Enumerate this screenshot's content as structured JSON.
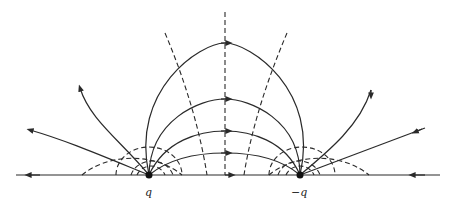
{
  "diagram": {
    "colors": {
      "line": "#2a2a2a",
      "background": "#ffffff"
    },
    "charges": [
      {
        "label": "q",
        "x": 149,
        "y": 175
      },
      {
        "label": "−q",
        "x": 300,
        "y": 175
      }
    ],
    "legend": {
      "solid": "field lines",
      "dashed": "equipotentials"
    }
  }
}
